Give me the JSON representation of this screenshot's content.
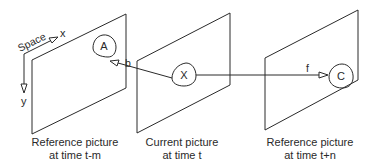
{
  "diagram": {
    "type": "motion-compensation-prediction",
    "stroke_color": "#2a2a2a",
    "background": "#ffffff",
    "axes": {
      "title": "Space",
      "x_label": "x",
      "y_label": "y"
    },
    "pictures": [
      {
        "id": "reference-past",
        "caption_line1": "Reference picture",
        "caption_line2": "at time t-m",
        "block_label": "A"
      },
      {
        "id": "current",
        "caption_line1": "Current picture",
        "caption_line2": "at time t",
        "block_label": "X"
      },
      {
        "id": "reference-future",
        "caption_line1": "Reference picture",
        "caption_line2": "at time t+n",
        "block_label": "C"
      }
    ],
    "vectors": [
      {
        "label": "b",
        "from": "X",
        "to": "A"
      },
      {
        "label": "f",
        "from": "X",
        "to": "C"
      }
    ]
  }
}
